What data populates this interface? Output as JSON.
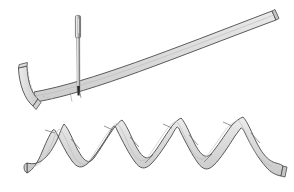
{
  "figure": {
    "title": "Needle piercing a curved band above a zigzag folded ribbon",
    "caption": "",
    "width": 294,
    "height": 192,
    "background_color": "#ffffff"
  },
  "palette": {
    "band_fill": "#d9d9d9",
    "band_fill_light": "#e8e8e8",
    "band_fill_shadow": "#c9c9c9",
    "outline": "#4a4a4a",
    "outline_soft": "#8a8a8a",
    "needle_body": "#9a9a9a",
    "needle_highlight": "#f0f0f0",
    "needle_dark": "#555555",
    "needle_tip": "#2b2b2b",
    "dashed_guide": "#9a9a9a"
  },
  "objects": {
    "upper_band": {
      "label": "curved band",
      "description": "Long slightly-curved flat strip rising from lower-left to upper-right",
      "start_point": [
        36,
        96
      ],
      "end_point": [
        276,
        14
      ],
      "thickness": 11,
      "segment_marks": 2
    },
    "hook_end": {
      "label": "hooked left end",
      "description": "The band's left end turns upward into a short hook with a dashed fold guide",
      "corner_point": [
        33,
        105
      ],
      "tip_point": [
        19,
        66
      ],
      "has_dashed_guide": true
    },
    "needle": {
      "label": "needle",
      "description": "Vertical sewing needle passing down through the band",
      "top_point": [
        78,
        16
      ],
      "bottom_point": [
        79,
        94
      ],
      "eye_top": [
        78,
        18
      ],
      "eye_bottom": [
        78,
        36
      ],
      "shaft_width": 2,
      "head_width": 6,
      "pierce_point": [
        79,
        91
      ]
    },
    "zigzag_ribbon": {
      "label": "zigzag ribbon",
      "description": "Accordion-folded flat ribbon with four peaks and three valleys",
      "thickness": 12,
      "peaks": 4,
      "valleys": 3,
      "left_tail": [
        27,
        170
      ],
      "right_tail": [
        283,
        170
      ],
      "peak_points": [
        [
          63,
          124
        ],
        [
          122,
          122
        ],
        [
          182,
          120
        ],
        [
          243,
          119
        ]
      ],
      "valley_points": [
        [
          93,
          158
        ],
        [
          152,
          156
        ],
        [
          212,
          155
        ]
      ]
    }
  }
}
